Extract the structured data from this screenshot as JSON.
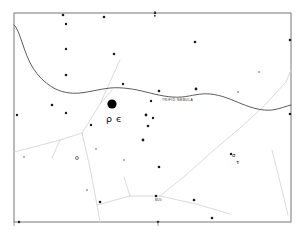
{
  "chart": {
    "type": "star-map",
    "frame": {
      "x": 14,
      "y": 13,
      "width": 277,
      "height": 209
    },
    "background_color": "#ffffff",
    "frame_color": "#777777"
  },
  "labels": {
    "trifid_nebula": "TRIFID NEBULA",
    "greek_rho": "ρ",
    "greek_epsilon": "є",
    "bottom_center": "M20",
    "right_sigma": "σ",
    "right_tau": "τ"
  },
  "chart_data": {
    "type": "scatter",
    "xlabel": "",
    "ylabel": "",
    "xlim": [
      14,
      291
    ],
    "ylim": [
      13,
      222
    ],
    "grid": false,
    "legend": "none",
    "annotations": [
      {
        "text": "TRIFID NEBULA",
        "x": 162,
        "y": 101
      },
      {
        "text": "ρ",
        "x": 106,
        "y": 122
      },
      {
        "text": "є",
        "x": 116,
        "y": 122
      },
      {
        "text": "M20",
        "x": 155,
        "y": 201
      },
      {
        "text": "σ",
        "x": 232,
        "y": 157
      },
      {
        "text": "τ",
        "x": 236,
        "y": 164
      }
    ],
    "nebula_markers": [
      {
        "name": "trifid-nebula-blob",
        "x": 112,
        "y": 104,
        "r": 4.6,
        "color": "#000000"
      }
    ],
    "stars": [
      {
        "x": 63,
        "y": 15,
        "r": 1.3
      },
      {
        "x": 66,
        "y": 24,
        "r": 1.2
      },
      {
        "x": 104,
        "y": 17,
        "r": 1.3
      },
      {
        "x": 66,
        "y": 49,
        "r": 1.2
      },
      {
        "x": 66,
        "y": 75,
        "r": 1.3
      },
      {
        "x": 114,
        "y": 54,
        "r": 1.3
      },
      {
        "x": 123,
        "y": 84,
        "r": 1.2
      },
      {
        "x": 159,
        "y": 91,
        "r": 1.3
      },
      {
        "x": 195,
        "y": 42,
        "r": 1.3
      },
      {
        "x": 196,
        "y": 89,
        "r": 1.4
      },
      {
        "x": 151,
        "y": 101,
        "r": 1.2
      },
      {
        "x": 146,
        "y": 115,
        "r": 1.4
      },
      {
        "x": 52,
        "y": 105,
        "r": 1.3
      },
      {
        "x": 66,
        "y": 113,
        "r": 1.2
      },
      {
        "x": 17,
        "y": 115,
        "r": 1.2
      },
      {
        "x": 290,
        "y": 114,
        "r": 1.3
      },
      {
        "x": 290,
        "y": 40,
        "r": 1.3
      },
      {
        "x": 91,
        "y": 125,
        "r": 1.2
      },
      {
        "x": 153,
        "y": 118,
        "r": 1.2
      },
      {
        "x": 148,
        "y": 126,
        "r": 1.3
      },
      {
        "x": 143,
        "y": 140,
        "r": 1.4
      },
      {
        "x": 77,
        "y": 158,
        "r": 1.5,
        "hollow": true
      },
      {
        "x": 159,
        "y": 167,
        "r": 1.3
      },
      {
        "x": 100,
        "y": 202,
        "r": 1.3
      },
      {
        "x": 156,
        "y": 196,
        "r": 1.3
      },
      {
        "x": 194,
        "y": 200,
        "r": 1.3
      },
      {
        "x": 231,
        "y": 154,
        "r": 1.2
      },
      {
        "x": 19,
        "y": 222,
        "r": 1.2
      },
      {
        "x": 158,
        "y": 222,
        "r": 1.2
      },
      {
        "x": 212,
        "y": 218,
        "r": 1.3
      },
      {
        "x": 155,
        "y": 13,
        "r": 1.2
      },
      {
        "x": 96,
        "y": 149,
        "r": 1.0,
        "faint": true
      },
      {
        "x": 124,
        "y": 160,
        "r": 1.0,
        "faint": true
      },
      {
        "x": 87,
        "y": 190,
        "r": 1.0,
        "faint": true
      },
      {
        "x": 24,
        "y": 157,
        "r": 1.0,
        "faint": true
      },
      {
        "x": 238,
        "y": 92,
        "r": 1.0,
        "faint": true
      },
      {
        "x": 259,
        "y": 72,
        "r": 1.0,
        "faint": true
      }
    ],
    "galactic_curve": "M 14,25 C 17,27 19,34 22,42 C 25,51 28,60 33,68 C 38,76 44,82 52,87 C 60,92 70,94 80,93 C 90,92 100,89 110,88 C 122,87 134,89 146,92 C 158,95 170,98 182,97 C 192,96 200,93 210,94 C 222,95 232,100 242,104 C 252,108 262,111 272,110 C 280,109 286,106 291,105",
    "constellation_lines": [
      "M 120,60 L 100,104",
      "M 100,104 L 82,133",
      "M 82,133 L 60,140",
      "M 60,140 L 30,148",
      "M 30,148 L 14,152",
      "M 60,140 L 52,158",
      "M 82,133 L 90,168",
      "M 90,168 L 97,205",
      "M 97,205 L 100,222",
      "M 97,205 L 130,196",
      "M 130,196 L 160,196",
      "M 160,196 L 186,175",
      "M 186,175 L 214,150",
      "M 214,150 L 240,128",
      "M 240,128 L 262,108",
      "M 262,108 L 286,82",
      "M 286,82 L 291,70",
      "M 160,196 L 196,204",
      "M 196,204 L 230,214",
      "M 272,150 L 282,190",
      "M 282,190 L 288,215",
      "M 100,104 L 112,90",
      "M 130,196 L 124,177"
    ]
  }
}
